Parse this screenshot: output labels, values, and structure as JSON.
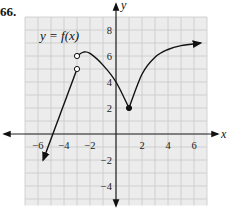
{
  "problem": {
    "number": "66."
  },
  "chart_data": {
    "type": "line",
    "title": "y = f(x)",
    "xlabel": "x",
    "ylabel": "y",
    "xlim": [
      -7,
      7
    ],
    "ylim": [
      -5.5,
      9
    ],
    "grid": true,
    "x_ticks": [
      -6,
      -4,
      -2,
      2,
      4,
      6
    ],
    "y_ticks": [
      -4,
      -2,
      2,
      4,
      6,
      8
    ],
    "x_tick_labels": [
      "−6",
      "−4",
      "−2",
      "2",
      "4",
      "6"
    ],
    "y_tick_labels": [
      "−4",
      "−2",
      "2",
      "4",
      "6",
      "8"
    ],
    "series": [
      {
        "name": "left piece (line, arrow at left end)",
        "points": [
          [
            -5.6,
            -2
          ],
          [
            -3,
            5
          ]
        ],
        "endpoints": {
          "left": "arrow",
          "right": "open circle at (-3, 5)"
        }
      },
      {
        "name": "middle piece (curve)",
        "points": [
          [
            -3,
            6
          ],
          [
            -2.5,
            6.3
          ],
          [
            -2,
            6.2
          ],
          [
            -1,
            5.3
          ],
          [
            0,
            4
          ],
          [
            1,
            2
          ]
        ],
        "endpoints": {
          "left": "open circle at (-3, 6)",
          "right": "closed dot at (1, 2)"
        }
      },
      {
        "name": "right piece (curve, arrow at right end)",
        "points": [
          [
            1,
            2
          ],
          [
            2,
            4.6
          ],
          [
            3,
            5.9
          ],
          [
            4,
            6.5
          ],
          [
            5,
            6.8
          ],
          [
            6.5,
            7
          ]
        ],
        "endpoints": {
          "left": "closed dot at (1, 2)",
          "right": "arrow"
        }
      }
    ],
    "marked_points": [
      {
        "x": -3,
        "y": 6,
        "style": "open"
      },
      {
        "x": -3,
        "y": 5,
        "style": "open"
      },
      {
        "x": 1,
        "y": 2,
        "style": "closed"
      }
    ]
  }
}
